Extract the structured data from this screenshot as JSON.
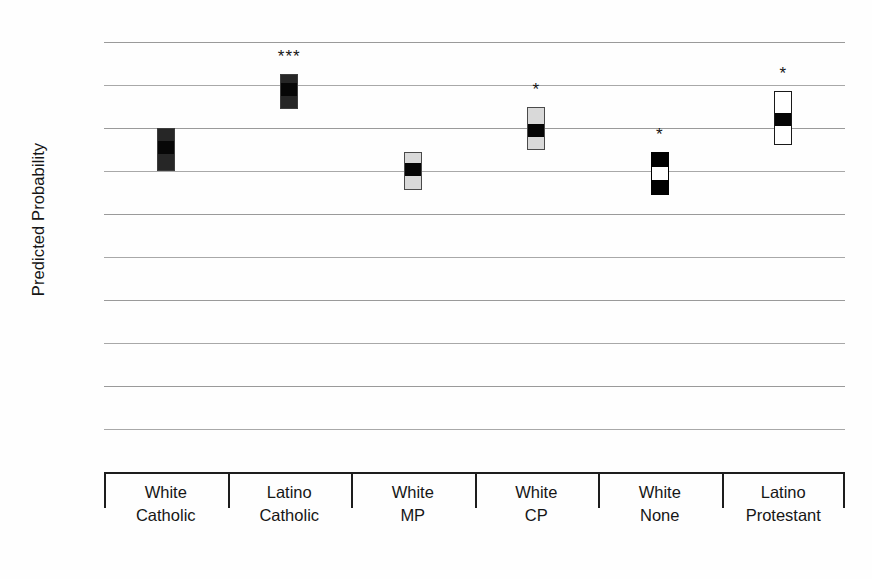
{
  "chart_data": {
    "type": "bar",
    "title": "",
    "subtitle": "",
    "xlabel": "",
    "ylabel": "Predicted Probability",
    "ylim": [
      0,
      1
    ],
    "ytick_labels": [
      "1",
      "0.9",
      "0.8",
      "0.7",
      "0.6",
      "0.5",
      "0.4",
      "0.3",
      "0.2",
      "0.1",
      "0"
    ],
    "ytick_values": [
      1,
      0.9,
      0.8,
      0.7,
      0.6,
      0.5,
      0.4,
      0.3,
      0.2,
      0.1,
      0
    ],
    "grid": true,
    "legend": "none",
    "categories": [
      "White Catholic",
      "Latino Catholic",
      "White MP",
      "White CP",
      "White None",
      "Latino Protestant"
    ],
    "category_lines": [
      [
        "White",
        "Catholic"
      ],
      [
        "Latino",
        "Catholic"
      ],
      [
        "White",
        "MP"
      ],
      [
        "White",
        "CP"
      ],
      [
        "White",
        "None"
      ],
      [
        "Latino",
        "Protestant"
      ]
    ],
    "series": [
      {
        "name": "Predicted Probability",
        "values": [
          0.755,
          0.89,
          0.705,
          0.795,
          0.695,
          0.822
        ],
        "ci_low": [
          0.7,
          0.845,
          0.655,
          0.75,
          0.645,
          0.76
        ],
        "ci_high": [
          0.8,
          0.925,
          0.745,
          0.85,
          0.745,
          0.885
        ]
      }
    ],
    "significance": [
      "",
      "***",
      "",
      "*",
      "*",
      "*"
    ],
    "bar_styles": [
      "dark",
      "dark",
      "light",
      "light",
      "black",
      "white"
    ],
    "point_styles": [
      "darker",
      "darker",
      "black",
      "black",
      "white",
      "black"
    ]
  },
  "axis": {
    "y_title": "Predicted Probability"
  }
}
